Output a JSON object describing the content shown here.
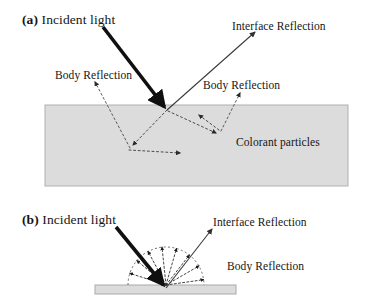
{
  "figure": {
    "title_present": false,
    "background_color": "#ffffff",
    "ink_color": "#151515",
    "slab_fill_color": "#dcdcdc",
    "slab_border_color": "#a9a9a9",
    "particle_color": "#000000",
    "dotted_line_color": "#555555"
  },
  "panel_a": {
    "tag": "(a)",
    "incident_label": "Incident light",
    "interface_reflection_label": "Interface Reflection",
    "body_reflection_left_label": "Body Reflection",
    "body_reflection_right_label": "Body Reflection",
    "colorant_label": "Colorant particles",
    "description": "Dichromatic reflection model for an inhomogeneous material: incident light hits the surface, part is reflected at the interface, part enters the medium, scatters off colorant particles and re-emerges as body reflection.",
    "slab": {
      "x": 45,
      "y": 105,
      "width": 303,
      "height": 81
    },
    "incident_ray": {
      "from": [
        103,
        27
      ],
      "to": [
        167,
        110
      ]
    },
    "interface_ray": {
      "from": [
        167,
        110
      ],
      "to": [
        256,
        31
      ]
    },
    "particles": [
      {
        "id": "p1",
        "points": "14,18 22,3 30,14 27,30 17,31"
      },
      {
        "id": "p2",
        "points": "2,55 28,47 45,51 48,58 30,64 8,63"
      },
      {
        "id": "p3",
        "points": "117,12 132,6 138,22 136,48 126,54 118,40"
      },
      {
        "id": "p4",
        "points": "92,46 106,40 113,53 110,66 96,68 88,58"
      },
      {
        "id": "p5",
        "points": "155,4 168,2 172,12 166,22 156,20 151,12"
      },
      {
        "id": "p6",
        "points": "148,44 164,38 172,52 170,76 158,82 146,66"
      },
      {
        "id": "p7",
        "points": "180,14 200,8 222,14 236,22 214,30 186,28"
      },
      {
        "id": "p8",
        "points": "216,50 230,46 236,56 230,65 218,64 212,56"
      },
      {
        "id": "p9",
        "points": "263,4 281,0 300,9 282,17 266,14"
      },
      {
        "id": "p10",
        "points": "264,62 280,56 295,62 290,72 270,73"
      },
      {
        "id": "p11",
        "points": "296,28 306,22 312,44 306,66 298,62 293,44"
      }
    ],
    "scatter_path": [
      [
        167,
        110
      ],
      [
        130,
        148
      ],
      [
        185,
        153
      ],
      [
        221,
        131
      ],
      [
        197,
        112
      ]
    ]
  },
  "panel_b": {
    "tag": "(b)",
    "incident_label": "Incident light",
    "interface_reflection_label": "Interface Reflection",
    "body_reflection_label": "Body Reflection",
    "description": "Dichromatic reflection model for an optically smooth homogeneous surface: a specular interface reflection lobe plus a diffuse body reflection fan.",
    "slab": {
      "x": 95,
      "y": 285,
      "width": 141,
      "height": 9
    },
    "incident_ray": {
      "from": [
        116,
        227
      ],
      "to": [
        166,
        288
      ]
    },
    "interface_ray": {
      "from": [
        166,
        288
      ],
      "to": [
        213,
        228
      ]
    },
    "fan_arrow_count": 8,
    "fan_angles_deg": [
      8,
      30,
      52,
      74,
      96,
      118,
      140,
      162
    ],
    "fan_radius": 38
  }
}
